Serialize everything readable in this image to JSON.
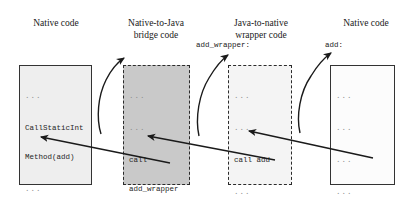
{
  "diagram": {
    "columns": [
      {
        "heading": "Native code"
      },
      {
        "heading": "Native-to-Java\nbridge code"
      },
      {
        "heading": "Java-to-native\nwrapper code"
      },
      {
        "heading": "Native code"
      }
    ],
    "entry_labels": {
      "wrapper": "add_wrapper:",
      "native": "add:"
    },
    "boxes": [
      {
        "name": "native-caller",
        "style": "solid",
        "fill": "#eeeeee",
        "lines": [
          "...",
          "CallStaticInt",
          "Method(add)",
          "..."
        ]
      },
      {
        "name": "bridge",
        "style": "dashed",
        "fill": "#c9c9c9",
        "lines": [
          "...",
          "...",
          "call",
          "add_wrapper",
          "...",
          "ret"
        ]
      },
      {
        "name": "wrapper",
        "style": "dashed",
        "fill": "#f4f4f4",
        "lines": [
          "...",
          "...",
          "call add",
          "...",
          "ret"
        ]
      },
      {
        "name": "native-callee",
        "style": "solid",
        "fill": "#fcfcfc",
        "lines": [
          "...",
          "...",
          "...",
          "...",
          "return"
        ]
      }
    ],
    "arrows": {
      "call_color": "#1a1a1a",
      "return_color": "#1a1a1a",
      "call_count": 3,
      "return_count": 3
    }
  }
}
